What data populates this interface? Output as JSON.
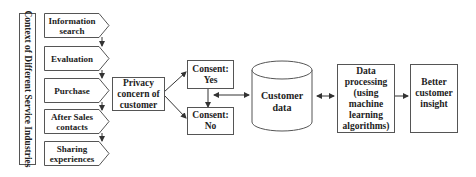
{
  "diagram": {
    "side_label": "Context of Different Service Industries",
    "stages": [
      {
        "label": "Information search"
      },
      {
        "label": "Evaluation"
      },
      {
        "label": "Purchase"
      },
      {
        "label": "After Sales contacts"
      },
      {
        "label": "Sharing experiences"
      }
    ],
    "privacy": {
      "label": "Privacy concern of customer"
    },
    "consent_yes": {
      "label": "Consent: Yes"
    },
    "consent_no": {
      "label": "Consent: No"
    },
    "customer_data": {
      "label": "Customer data"
    },
    "data_processing": {
      "label": "Data processing (using machine learning algorithms)"
    },
    "insight": {
      "label": "Better customer insight"
    },
    "colors": {
      "stroke": "#555555",
      "text": "#222222",
      "background": "#ffffff"
    }
  }
}
